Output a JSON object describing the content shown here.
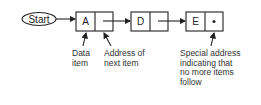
{
  "diagram": {
    "start_label": "Start",
    "nodes": [
      {
        "data": "A",
        "pointer": "next"
      },
      {
        "data": "D",
        "pointer": "next"
      },
      {
        "data": "E",
        "pointer": "null"
      }
    ],
    "null_marker": "•",
    "annotations": {
      "data_item": "Data\nitem",
      "next_address": "Address of\nnext item",
      "null_address": "Special address\nindicating that\nno more items\nfollow"
    },
    "colors": {
      "stroke": "#222222",
      "background": "#ffffff"
    }
  }
}
